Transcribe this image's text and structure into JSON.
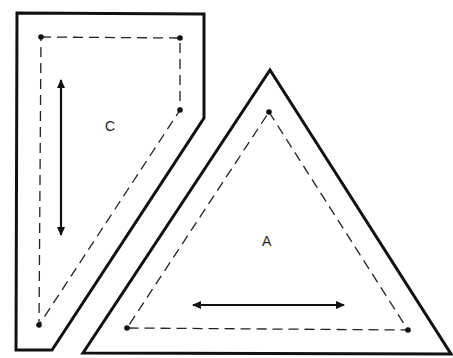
{
  "diagram": {
    "title": "",
    "colors": {
      "line": "#111111",
      "background": "#ffffff"
    },
    "pieces": [
      {
        "id": "C",
        "label": "C",
        "label_pos": [
          111,
          130
        ],
        "cut_outline": [
          [
            17,
            13
          ],
          [
            204,
            14
          ],
          [
            204,
            118
          ],
          [
            52,
            350
          ],
          [
            16,
            350
          ]
        ],
        "seam_line": [
          [
            41,
            37
          ],
          [
            180,
            38
          ],
          [
            180,
            110
          ],
          [
            39,
            325
          ]
        ],
        "corner_dots": [
          [
            41,
            37
          ],
          [
            180,
            38
          ],
          [
            180,
            110
          ],
          [
            39,
            325
          ]
        ],
        "grainline": {
          "orientation": "vertical",
          "from": [
            61,
            78
          ],
          "to": [
            61,
            237
          ],
          "double_headed": true
        }
      },
      {
        "id": "A",
        "label": "A",
        "label_pos": [
          268,
          245
        ],
        "cut_outline": [
          [
            270,
            70
          ],
          [
            451,
            354
          ],
          [
            83,
            353
          ]
        ],
        "seam_line": [
          [
            269,
            112
          ],
          [
            408,
            330
          ],
          [
            127,
            328
          ]
        ],
        "corner_dots": [
          [
            269,
            112
          ],
          [
            408,
            330
          ],
          [
            127,
            328
          ]
        ],
        "grainline": {
          "orientation": "horizontal",
          "from": [
            191,
            305
          ],
          "to": [
            346,
            305
          ],
          "double_headed": true
        }
      }
    ]
  }
}
